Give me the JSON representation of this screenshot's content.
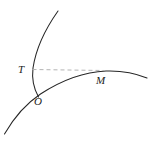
{
  "figure": {
    "type": "geometry-diagram",
    "background_color": "#ffffff",
    "width": 153,
    "height": 145,
    "stroke_color": "#262626",
    "dashed_color": "#b4b4b4",
    "labels": [
      {
        "id": "T",
        "text": "T",
        "x": 18,
        "y": 64
      },
      {
        "id": "O",
        "text": "O",
        "x": 34,
        "y": 96
      },
      {
        "id": "M",
        "text": "M",
        "x": 96,
        "y": 75
      }
    ],
    "curves": [
      {
        "name": "steep-curve",
        "style": "solid",
        "path": "M 58 11 C 46 28, 36 48, 33 68 C 31.5 80, 34 89, 38.5 97"
      },
      {
        "name": "main-arc",
        "style": "solid",
        "path": "M 4.5 134 C 16 114, 27 103, 40.5 94 C 62 80, 84 72, 106 71 C 121 70.5, 135 73, 147 78"
      },
      {
        "name": "dashed-tangent-line",
        "style": "dashed",
        "path": "M 32.5 69.5 L 104 70.5"
      }
    ]
  }
}
